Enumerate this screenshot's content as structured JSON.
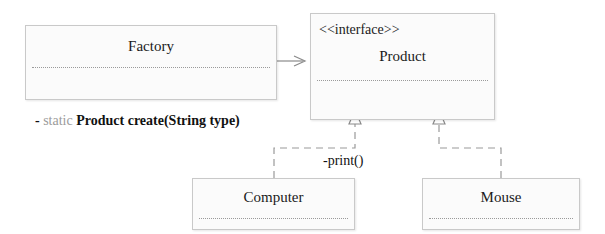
{
  "diagram": {
    "type": "uml-class-diagram",
    "background_color": "#ffffff",
    "box_fill": "#fbfbfb",
    "box_border": "#c9c9c9",
    "line_color": "#8a8a8a",
    "text_color": "#1a1a1a",
    "muted_text_color": "#9b9b9b"
  },
  "classes": {
    "factory": {
      "name": "Factory",
      "stereotype": "",
      "methods": [
        {
          "visibility": "-",
          "modifier": "static",
          "signature": "Product create(String type)"
        }
      ]
    },
    "product": {
      "name": "Product",
      "stereotype": "<<interface>>",
      "methods": [
        {
          "visibility": "",
          "modifier": "",
          "signature": "-print()"
        }
      ]
    },
    "computer": {
      "name": "Computer",
      "stereotype": "",
      "methods": []
    },
    "mouse": {
      "name": "Mouse",
      "stereotype": "",
      "methods": []
    }
  },
  "relationships": [
    {
      "name": "factory-uses-product",
      "from": "Factory",
      "to": "Product",
      "kind": "association",
      "line_style": "solid",
      "arrowhead": "open-arrow"
    },
    {
      "name": "computer-realizes-product",
      "from": "Computer",
      "to": "Product",
      "kind": "realization",
      "line_style": "dashed",
      "arrowhead": "hollow-triangle"
    },
    {
      "name": "mouse-realizes-product",
      "from": "Mouse",
      "to": "Product",
      "kind": "realization",
      "line_style": "dashed",
      "arrowhead": "hollow-triangle"
    }
  ]
}
